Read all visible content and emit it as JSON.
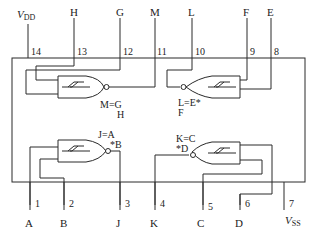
{
  "diagram": {
    "supply": {
      "vdd": "V",
      "vdd_sub": "DD",
      "vss": "V",
      "vss_sub": "SS"
    },
    "top_pins": [
      {
        "num": "14",
        "signal": "VDD"
      },
      {
        "num": "13",
        "signal": "H"
      },
      {
        "num": "12",
        "signal": "G"
      },
      {
        "num": "11",
        "signal": "M"
      },
      {
        "num": "10",
        "signal": "L"
      },
      {
        "num": "9",
        "signal": "F"
      },
      {
        "num": "8",
        "signal": "E"
      }
    ],
    "bottom_pins": [
      {
        "num": "1",
        "signal": "A"
      },
      {
        "num": "2",
        "signal": "B"
      },
      {
        "num": "3",
        "signal": "J"
      },
      {
        "num": "4",
        "signal": "K"
      },
      {
        "num": "5",
        "signal": "C"
      },
      {
        "num": "6",
        "signal": "D"
      },
      {
        "num": "7",
        "signal": "VSS"
      }
    ],
    "gates": [
      {
        "id": "gate-1",
        "eq_line1": "M=G",
        "eq_line2": "H"
      },
      {
        "id": "gate-2",
        "eq_line1": "L=E*",
        "eq_line2": "F"
      },
      {
        "id": "gate-3",
        "eq_line1": "J=A",
        "eq_line2": "*B"
      },
      {
        "id": "gate-4",
        "eq_line1": "K=C",
        "eq_line2": "*D"
      }
    ]
  }
}
